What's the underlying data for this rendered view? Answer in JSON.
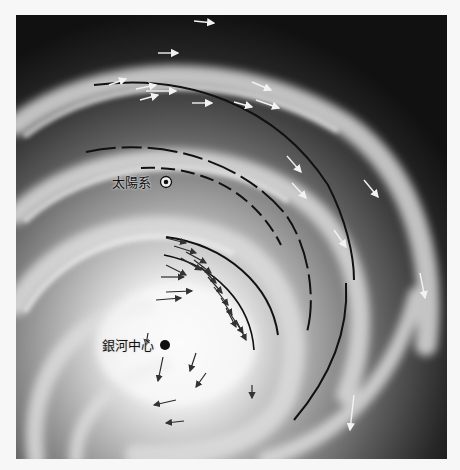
{
  "figure": {
    "labels": {
      "solar_system": "太陽系",
      "galactic_center": "銀河中心"
    },
    "markers": {
      "solar_system_symbol": "sun-symbol",
      "galactic_center_symbol": "filled-dot"
    },
    "colors": {
      "background_page": "#f7f7f7",
      "space": "#111111",
      "arm_light": "#e6e6e6",
      "arc": "#111111",
      "arrow_outer": "#f2f2f2",
      "arrow_inner": "#333333"
    }
  }
}
